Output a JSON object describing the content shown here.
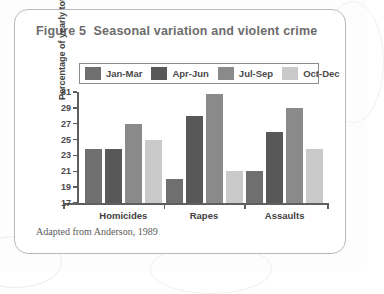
{
  "figure": {
    "title": "Figure 5  Seasonal variation and violent crime",
    "caption": "Adapted from Anderson, 1989"
  },
  "colors": {
    "jan_mar": "#6f6f6f",
    "apr_jun": "#585858",
    "jul_sep": "#8a8a8a",
    "oct_dec": "#c9c9c9",
    "axis": "#5e5e5e",
    "card_border": "#b9b9b9",
    "title_text": "#6c6c6c"
  },
  "chart_data": {
    "type": "bar",
    "title": "Figure 5  Seasonal variation and violent crime",
    "xlabel": "",
    "ylabel": "Percentage of yearly total",
    "ylim": [
      17,
      31
    ],
    "yticks": [
      17,
      19,
      21,
      23,
      25,
      27,
      29,
      31
    ],
    "ytick_labels": [
      "17",
      "19",
      "21",
      "23",
      "25",
      "27",
      "29",
      "31"
    ],
    "grid": false,
    "legend_position": "top",
    "categories": [
      "Homicides",
      "Rapes",
      "Assaults"
    ],
    "series": [
      {
        "name": "Jan-Mar",
        "color": "#6f6f6f",
        "values": [
          23.8,
          20.0,
          21.0
        ]
      },
      {
        "name": "Apr-Jun",
        "color": "#585858",
        "values": [
          23.8,
          28.0,
          26.0
        ]
      },
      {
        "name": "Jul-Sep",
        "color": "#8a8a8a",
        "values": [
          27.0,
          30.8,
          29.0
        ]
      },
      {
        "name": "Oct-Dec",
        "color": "#c9c9c9",
        "values": [
          25.0,
          21.0,
          23.8
        ]
      }
    ],
    "source_note": "Adapted from Anderson, 1989"
  }
}
